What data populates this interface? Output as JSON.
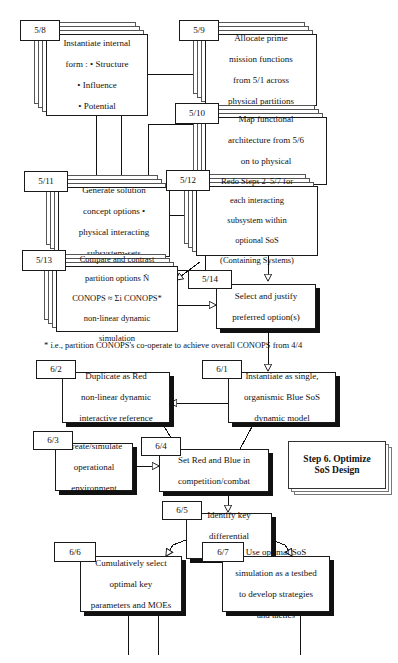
{
  "diagram": {
    "title_note": "Systems engineering flow — Step 5 partitioning into Step 6 SoS optimization",
    "footnote": "* i.e., partition CONOPS's co-operate to achieve overall CONOPS from 4/4",
    "legend": {
      "line1": "Step 6. Optimize",
      "line2": "SoS Design"
    }
  },
  "nodes": [
    {
      "id": "5/8",
      "tag": "5/8",
      "lines": [
        "Instantiate internal",
        "form : • Structure",
        "• Influence",
        "• Potential"
      ]
    },
    {
      "id": "5/9",
      "tag": "5/9",
      "lines": [
        "Allocate prime",
        "mission functions",
        "from 5/1 across",
        "physical partitions"
      ]
    },
    {
      "id": "5/10",
      "tag": "5/10",
      "lines": [
        "Map functional",
        "architecture from 5/6",
        "on to physical",
        "subsystem-sets"
      ]
    },
    {
      "id": "5/11",
      "tag": "5/11",
      "lines": [
        "Generate solution",
        "concept options •",
        "physical interacting",
        "subsystem-sets"
      ]
    },
    {
      "id": "5/12",
      "tag": "5/12",
      "lines": [
        "Redo Steps 2–5/7 for",
        "each interacting",
        "subsystem within",
        "optional SoS",
        "(Containing Systems)"
      ]
    },
    {
      "id": "5/13",
      "tag": "5/13",
      "lines": [
        "Compare and contrast",
        "partition options Ñ",
        "CONOPS ≈ Σi CONOPS*",
        "non-linear dynamic",
        "simulation"
      ]
    },
    {
      "id": "5/14",
      "tag": "5/14",
      "lines": [
        "Select and justify",
        "preferred option(s)"
      ]
    },
    {
      "id": "6/1",
      "tag": "6/1",
      "lines": [
        "Instantiate as single,",
        "organismic Blue SoS",
        "dynamic model"
      ]
    },
    {
      "id": "6/2",
      "tag": "6/2",
      "lines": [
        "Duplicate as Red",
        "non-linear dynamic",
        "interactive reference"
      ]
    },
    {
      "id": "6/3",
      "tag": "6/3",
      "lines": [
        "Create/simulate",
        "operational",
        "environment"
      ]
    },
    {
      "id": "6/4",
      "tag": "6/4",
      "lines": [
        "Set Red and Blue in",
        "competition/combat"
      ]
    },
    {
      "id": "6/5",
      "tag": "6/5",
      "lines": [
        "Identify key",
        "differential",
        "parameters"
      ]
    },
    {
      "id": "6/6",
      "tag": "6/6",
      "lines": [
        "Cumulatively select",
        "optimal key",
        "parameters and MOEs"
      ]
    },
    {
      "id": "6/7",
      "tag": "6/7",
      "lines": [
        "Use optimal SoS",
        "simulation as a testbed",
        "to develop strategies",
        "and tactics"
      ]
    }
  ]
}
